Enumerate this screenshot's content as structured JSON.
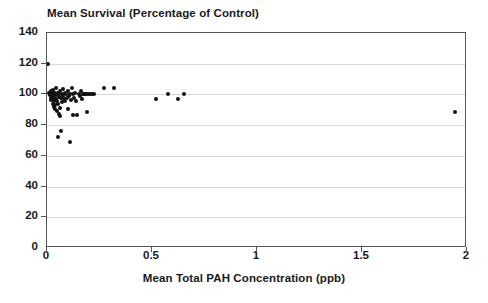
{
  "chart_data": {
    "type": "scatter",
    "title": "Mean Survival (Percentage of Control)",
    "xlabel": "Mean Total PAH Concentration (ppb)",
    "ylabel": "",
    "xlim": [
      0,
      2
    ],
    "ylim": [
      0,
      140
    ],
    "xticks": [
      0,
      0.5,
      1,
      1.5,
      2
    ],
    "xtick_labels": [
      "0",
      "0.5",
      "1",
      "1.5",
      "2"
    ],
    "yticks": [
      0,
      20,
      40,
      60,
      80,
      100,
      120,
      140
    ],
    "ytick_labels": [
      "0",
      "20",
      "40",
      "60",
      "80",
      "100",
      "120",
      "140"
    ],
    "grid": "horizontal",
    "legend": "none",
    "marker": "filled-circle",
    "marker_color": "#111111",
    "gridline_color": "#d9d9d9",
    "axis_color": "#555555",
    "background_color": "#ffffff",
    "points": [
      [
        0.005,
        120.0
      ],
      [
        0.01,
        101.0
      ],
      [
        0.012,
        100.5
      ],
      [
        0.014,
        99.5
      ],
      [
        0.016,
        100.0
      ],
      [
        0.018,
        98.0
      ],
      [
        0.02,
        102.0
      ],
      [
        0.02,
        96.5
      ],
      [
        0.022,
        100.0
      ],
      [
        0.024,
        99.0
      ],
      [
        0.025,
        101.5
      ],
      [
        0.026,
        97.0
      ],
      [
        0.028,
        100.0
      ],
      [
        0.029,
        94.0
      ],
      [
        0.03,
        103.0
      ],
      [
        0.03,
        99.0
      ],
      [
        0.032,
        95.5
      ],
      [
        0.033,
        100.5
      ],
      [
        0.034,
        92.0
      ],
      [
        0.035,
        98.0
      ],
      [
        0.036,
        101.0
      ],
      [
        0.038,
        93.0
      ],
      [
        0.04,
        100.0
      ],
      [
        0.04,
        90.5
      ],
      [
        0.042,
        97.0
      ],
      [
        0.044,
        104.0
      ],
      [
        0.045,
        99.5
      ],
      [
        0.046,
        89.0
      ],
      [
        0.048,
        96.0
      ],
      [
        0.05,
        101.0
      ],
      [
        0.05,
        93.5
      ],
      [
        0.052,
        72.0
      ],
      [
        0.055,
        100.0
      ],
      [
        0.056,
        87.0
      ],
      [
        0.058,
        98.5
      ],
      [
        0.06,
        91.0
      ],
      [
        0.062,
        102.0
      ],
      [
        0.064,
        86.0
      ],
      [
        0.066,
        97.5
      ],
      [
        0.068,
        76.0
      ],
      [
        0.07,
        100.0
      ],
      [
        0.072,
        95.0
      ],
      [
        0.075,
        103.5
      ],
      [
        0.078,
        99.0
      ],
      [
        0.08,
        97.0
      ],
      [
        0.085,
        101.0
      ],
      [
        0.088,
        96.0
      ],
      [
        0.09,
        100.0
      ],
      [
        0.095,
        98.0
      ],
      [
        0.1,
        102.5
      ],
      [
        0.1,
        90.5
      ],
      [
        0.105,
        99.0
      ],
      [
        0.108,
        69.0
      ],
      [
        0.11,
        100.5
      ],
      [
        0.115,
        96.5
      ],
      [
        0.12,
        104.0
      ],
      [
        0.122,
        86.5
      ],
      [
        0.125,
        100.0
      ],
      [
        0.13,
        98.0
      ],
      [
        0.135,
        101.0
      ],
      [
        0.14,
        96.0
      ],
      [
        0.145,
        86.5
      ],
      [
        0.15,
        100.0
      ],
      [
        0.155,
        99.0
      ],
      [
        0.16,
        102.0
      ],
      [
        0.165,
        97.0
      ],
      [
        0.17,
        100.5
      ],
      [
        0.175,
        100.0
      ],
      [
        0.18,
        100.0
      ],
      [
        0.185,
        100.0
      ],
      [
        0.19,
        88.5
      ],
      [
        0.195,
        100.0
      ],
      [
        0.205,
        100.0
      ],
      [
        0.215,
        100.0
      ],
      [
        0.225,
        100.0
      ],
      [
        0.27,
        104.0
      ],
      [
        0.32,
        104.0
      ],
      [
        0.52,
        97.0
      ],
      [
        0.575,
        100.5
      ],
      [
        0.625,
        97.0
      ],
      [
        0.65,
        100.0
      ],
      [
        1.945,
        88.5
      ]
    ]
  }
}
